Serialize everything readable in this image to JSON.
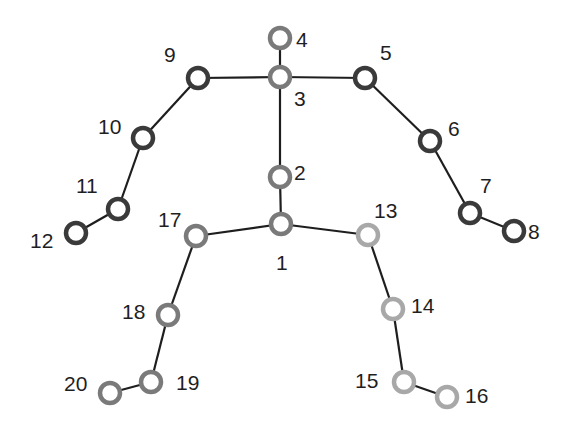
{
  "diagram": {
    "title": "",
    "type": "skeleton-joint-graph",
    "colors": {
      "background": "#ffffff",
      "bone": "#1e1e1e",
      "label": "#1f1f1f",
      "arms": "#3a3a3a",
      "spine": "#7a7a7a",
      "left_leg": "#7a7a7a",
      "right_leg": "#a8a8a8"
    },
    "joint_radius": 10,
    "joints": [
      {
        "id": "1",
        "label": "1",
        "x": 281,
        "y": 224,
        "group": "spine",
        "label_x": 276,
        "label_y": 270
      },
      {
        "id": "2",
        "label": "2",
        "x": 280,
        "y": 177,
        "group": "spine",
        "label_x": 294,
        "label_y": 180
      },
      {
        "id": "3",
        "label": "3",
        "x": 280,
        "y": 77,
        "group": "spine",
        "label_x": 294,
        "label_y": 106
      },
      {
        "id": "4",
        "label": "4",
        "x": 280,
        "y": 38,
        "group": "spine",
        "label_x": 296,
        "label_y": 47
      },
      {
        "id": "5",
        "label": "5",
        "x": 365,
        "y": 78,
        "group": "arms",
        "label_x": 380,
        "label_y": 60
      },
      {
        "id": "6",
        "label": "6",
        "x": 430,
        "y": 141,
        "group": "arms",
        "label_x": 448,
        "label_y": 136
      },
      {
        "id": "7",
        "label": "7",
        "x": 470,
        "y": 213,
        "group": "arms",
        "label_x": 480,
        "label_y": 193
      },
      {
        "id": "8",
        "label": "8",
        "x": 514,
        "y": 231,
        "group": "arms",
        "label_x": 528,
        "label_y": 239
      },
      {
        "id": "9",
        "label": "9",
        "x": 198,
        "y": 78,
        "group": "arms",
        "label_x": 164,
        "label_y": 62
      },
      {
        "id": "10",
        "label": "10",
        "x": 143,
        "y": 138,
        "group": "arms",
        "label_x": 98,
        "label_y": 134
      },
      {
        "id": "11",
        "label": "11",
        "x": 118,
        "y": 209,
        "group": "arms",
        "label_x": 76,
        "label_y": 193
      },
      {
        "id": "12",
        "label": "12",
        "x": 76,
        "y": 233,
        "group": "arms",
        "label_x": 30,
        "label_y": 248
      },
      {
        "id": "13",
        "label": "13",
        "x": 368,
        "y": 235,
        "group": "right_leg",
        "label_x": 374,
        "label_y": 218
      },
      {
        "id": "14",
        "label": "14",
        "x": 393,
        "y": 309,
        "group": "right_leg",
        "label_x": 411,
        "label_y": 313
      },
      {
        "id": "15",
        "label": "15",
        "x": 404,
        "y": 382,
        "group": "right_leg",
        "label_x": 355,
        "label_y": 388
      },
      {
        "id": "16",
        "label": "16",
        "x": 447,
        "y": 397,
        "group": "right_leg",
        "label_x": 465,
        "label_y": 403
      },
      {
        "id": "17",
        "label": "17",
        "x": 196,
        "y": 236,
        "group": "left_leg",
        "label_x": 158,
        "label_y": 227
      },
      {
        "id": "18",
        "label": "18",
        "x": 168,
        "y": 315,
        "group": "left_leg",
        "label_x": 122,
        "label_y": 319
      },
      {
        "id": "19",
        "label": "19",
        "x": 151,
        "y": 382,
        "group": "left_leg",
        "label_x": 176,
        "label_y": 390
      },
      {
        "id": "20",
        "label": "20",
        "x": 110,
        "y": 393,
        "group": "left_leg",
        "label_x": 64,
        "label_y": 391
      }
    ],
    "bones": [
      [
        "1",
        "2"
      ],
      [
        "2",
        "3"
      ],
      [
        "3",
        "4"
      ],
      [
        "3",
        "5"
      ],
      [
        "5",
        "6"
      ],
      [
        "6",
        "7"
      ],
      [
        "7",
        "8"
      ],
      [
        "3",
        "9"
      ],
      [
        "9",
        "10"
      ],
      [
        "10",
        "11"
      ],
      [
        "11",
        "12"
      ],
      [
        "1",
        "13"
      ],
      [
        "13",
        "14"
      ],
      [
        "14",
        "15"
      ],
      [
        "15",
        "16"
      ],
      [
        "1",
        "17"
      ],
      [
        "17",
        "18"
      ],
      [
        "18",
        "19"
      ],
      [
        "19",
        "20"
      ]
    ]
  }
}
